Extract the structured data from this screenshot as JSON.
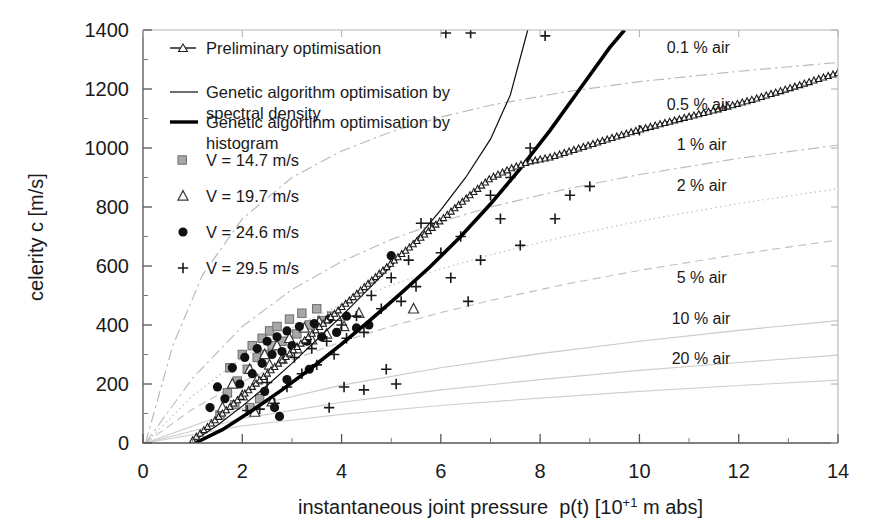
{
  "chart_data": {
    "type": "scatter",
    "title": "",
    "xlabel": "instantaneous joint pressure  p(t) [10+1 m abs]",
    "xlabel_main": "instantaneous joint pressure  p(t) [10",
    "xlabel_sup": "+1",
    "xlabel_tail": " m abs]",
    "ylabel": "celerity c [m/s]",
    "xlim": [
      0,
      14
    ],
    "ylim": [
      0,
      1400
    ],
    "xticks": [
      "0",
      "2",
      "4",
      "6",
      "8",
      "10",
      "12",
      "14"
    ],
    "xtick_values": [
      0,
      2,
      4,
      6,
      8,
      10,
      12,
      14
    ],
    "yticks": [
      "0",
      "200",
      "400",
      "600",
      "800",
      "1000",
      "1200",
      "1400"
    ],
    "ytick_values": [
      0,
      200,
      400,
      600,
      800,
      1000,
      1200,
      1400
    ],
    "x_minor_step": 0.5,
    "y_minor_step": 100,
    "grid": false,
    "legend_position": "upper-left-inside",
    "series": [
      {
        "name": "Preliminary optimisation",
        "style": "line-with-open-triangle-markers",
        "color": "#202020",
        "points": [
          [
            1.0,
            10
          ],
          [
            1.2,
            40
          ],
          [
            1.5,
            85
          ],
          [
            1.8,
            130
          ],
          [
            2.0,
            160
          ],
          [
            2.3,
            205
          ],
          [
            2.6,
            250
          ],
          [
            3.0,
            310
          ],
          [
            3.4,
            370
          ],
          [
            3.8,
            430
          ],
          [
            4.2,
            490
          ],
          [
            4.6,
            550
          ],
          [
            5.0,
            610
          ],
          [
            5.4,
            668
          ],
          [
            5.8,
            726
          ],
          [
            6.2,
            784
          ],
          [
            6.6,
            842
          ],
          [
            7.0,
            898
          ],
          [
            7.4,
            930
          ],
          [
            7.8,
            955
          ],
          [
            8.2,
            968
          ],
          [
            8.8,
            1000
          ],
          [
            9.4,
            1032
          ],
          [
            10.0,
            1062
          ],
          [
            10.8,
            1098
          ],
          [
            11.6,
            1132
          ],
          [
            12.4,
            1170
          ],
          [
            13.2,
            1212
          ],
          [
            14.0,
            1255
          ]
        ]
      },
      {
        "name": "Genetic algorithm optimisation by spectral density",
        "style": "thin-solid-line",
        "color": "#111111",
        "points": [
          [
            1.0,
            5
          ],
          [
            1.5,
            60
          ],
          [
            2.0,
            125
          ],
          [
            2.5,
            195
          ],
          [
            3.0,
            270
          ],
          [
            3.5,
            350
          ],
          [
            4.0,
            430
          ],
          [
            4.5,
            515
          ],
          [
            5.0,
            600
          ],
          [
            5.5,
            690
          ],
          [
            6.0,
            790
          ],
          [
            6.5,
            900
          ],
          [
            7.0,
            1030
          ],
          [
            7.4,
            1180
          ],
          [
            7.75,
            1400
          ]
        ]
      },
      {
        "name": "Genetic algortihm optimisation by histogram",
        "style": "thick-solid-line",
        "color": "#000000",
        "points": [
          [
            1.05,
            0
          ],
          [
            1.6,
            45
          ],
          [
            2.2,
            110
          ],
          [
            2.8,
            180
          ],
          [
            3.4,
            255
          ],
          [
            4.0,
            335
          ],
          [
            4.6,
            420
          ],
          [
            5.2,
            508
          ],
          [
            5.8,
            600
          ],
          [
            6.4,
            700
          ],
          [
            7.0,
            810
          ],
          [
            7.6,
            930
          ],
          [
            8.2,
            1060
          ],
          [
            8.8,
            1200
          ],
          [
            9.4,
            1340
          ],
          [
            9.7,
            1400
          ]
        ]
      },
      {
        "name": "V = 14.7 m/s",
        "style": "gray-square-markers",
        "color": "#9a9a9a",
        "points": [
          [
            1.55,
            95
          ],
          [
            1.7,
            170
          ],
          [
            1.75,
            255
          ],
          [
            1.9,
            210
          ],
          [
            2.0,
            300
          ],
          [
            2.1,
            250
          ],
          [
            2.2,
            330
          ],
          [
            2.3,
            290
          ],
          [
            2.4,
            355
          ],
          [
            2.45,
            300
          ],
          [
            2.55,
            380
          ],
          [
            2.6,
            330
          ],
          [
            2.7,
            395
          ],
          [
            2.8,
            345
          ],
          [
            2.95,
            420
          ],
          [
            3.1,
            370
          ],
          [
            3.2,
            440
          ],
          [
            3.35,
            400
          ],
          [
            3.5,
            455
          ],
          [
            3.6,
            415
          ],
          [
            3.8,
            430
          ],
          [
            2.15,
            120
          ],
          [
            2.35,
            150
          ],
          [
            1.85,
            130
          ]
        ]
      },
      {
        "name": "V = 19.7 m/s",
        "style": "open-triangle-markers",
        "color": "#4a4a4a",
        "points": [
          [
            1.6,
            120
          ],
          [
            1.8,
            200
          ],
          [
            2.0,
            160
          ],
          [
            2.15,
            250
          ],
          [
            2.3,
            215
          ],
          [
            2.45,
            300
          ],
          [
            2.55,
            265
          ],
          [
            2.7,
            330
          ],
          [
            2.8,
            285
          ],
          [
            2.95,
            355
          ],
          [
            3.1,
            320
          ],
          [
            3.25,
            390
          ],
          [
            3.4,
            350
          ],
          [
            3.55,
            410
          ],
          [
            3.7,
            370
          ],
          [
            3.9,
            430
          ],
          [
            4.05,
            395
          ],
          [
            4.35,
            440
          ],
          [
            5.45,
            455
          ],
          [
            2.25,
            105
          ],
          [
            2.6,
            140
          ]
        ]
      },
      {
        "name": "V = 24.6 m/s",
        "style": "filled-circle-markers",
        "color": "#111111",
        "points": [
          [
            1.35,
            120
          ],
          [
            1.5,
            190
          ],
          [
            1.65,
            150
          ],
          [
            1.8,
            255
          ],
          [
            1.95,
            200
          ],
          [
            2.05,
            290
          ],
          [
            2.2,
            235
          ],
          [
            2.3,
            320
          ],
          [
            2.4,
            270
          ],
          [
            2.5,
            345
          ],
          [
            2.6,
            300
          ],
          [
            2.7,
            360
          ],
          [
            2.8,
            310
          ],
          [
            2.9,
            380
          ],
          [
            3.0,
            330
          ],
          [
            3.15,
            395
          ],
          [
            3.3,
            345
          ],
          [
            3.45,
            405
          ],
          [
            3.6,
            360
          ],
          [
            3.75,
            420
          ],
          [
            3.9,
            375
          ],
          [
            4.1,
            430
          ],
          [
            4.3,
            390
          ],
          [
            4.55,
            400
          ],
          [
            5.0,
            635
          ],
          [
            2.45,
            175
          ],
          [
            2.9,
            215
          ],
          [
            3.35,
            250
          ],
          [
            2.65,
            120
          ],
          [
            2.75,
            90
          ]
        ]
      },
      {
        "name": "V = 29.5 m/s",
        "style": "plus-markers",
        "color": "#1a1a1a",
        "points": [
          [
            2.1,
            110
          ],
          [
            2.35,
            115
          ],
          [
            2.5,
            205
          ],
          [
            2.65,
            135
          ],
          [
            2.9,
            190
          ],
          [
            3.05,
            290
          ],
          [
            3.2,
            235
          ],
          [
            3.4,
            320
          ],
          [
            3.5,
            265
          ],
          [
            3.7,
            345
          ],
          [
            3.85,
            300
          ],
          [
            4.0,
            400
          ],
          [
            4.1,
            355
          ],
          [
            4.3,
            430
          ],
          [
            4.45,
            375
          ],
          [
            4.6,
            500
          ],
          [
            4.8,
            455
          ],
          [
            5.0,
            560
          ],
          [
            5.2,
            480
          ],
          [
            5.35,
            620
          ],
          [
            5.5,
            530
          ],
          [
            5.6,
            745
          ],
          [
            5.8,
            745
          ],
          [
            6.0,
            645
          ],
          [
            6.2,
            560
          ],
          [
            6.4,
            700
          ],
          [
            6.55,
            480
          ],
          [
            6.8,
            620
          ],
          [
            7.0,
            840
          ],
          [
            7.2,
            760
          ],
          [
            7.4,
            900
          ],
          [
            7.6,
            670
          ],
          [
            7.8,
            1000
          ],
          [
            8.1,
            1380
          ],
          [
            8.3,
            760
          ],
          [
            8.6,
            840
          ],
          [
            9.0,
            870
          ],
          [
            10.0,
            1060
          ],
          [
            6.1,
            1390
          ],
          [
            6.6,
            1390
          ],
          [
            4.05,
            190
          ],
          [
            4.45,
            180
          ],
          [
            5.1,
            200
          ],
          [
            3.75,
            120
          ],
          [
            4.9,
            250
          ]
        ]
      }
    ],
    "air_curves": [
      {
        "label": "0.1 % air",
        "percent": 0.1,
        "dash": "dash-dot",
        "color": "#b9b9b9",
        "points": [
          [
            0.05,
            0
          ],
          [
            0.6,
            330
          ],
          [
            1.2,
            570
          ],
          [
            2.0,
            760
          ],
          [
            3.0,
            900
          ],
          [
            4.0,
            990
          ],
          [
            5.0,
            1055
          ],
          [
            6.0,
            1105
          ],
          [
            7.0,
            1145
          ],
          [
            8.5,
            1190
          ],
          [
            10.0,
            1225
          ],
          [
            12.0,
            1260
          ],
          [
            14.0,
            1290
          ]
        ]
      },
      {
        "label": "0.5 % air",
        "percent": 0.5,
        "dash": "dash-dot",
        "color": "#bdbdbd",
        "points": [
          [
            0.05,
            0
          ],
          [
            1.0,
            220
          ],
          [
            2.0,
            395
          ],
          [
            3.0,
            520
          ],
          [
            4.0,
            615
          ],
          [
            5.0,
            690
          ],
          [
            6.0,
            750
          ],
          [
            7.0,
            800
          ],
          [
            8.5,
            860
          ],
          [
            10.0,
            910
          ],
          [
            12.0,
            965
          ],
          [
            14.0,
            1010
          ]
        ]
      },
      {
        "label": "1 % air",
        "percent": 1,
        "dash": "dotted",
        "color": "#c0c0c0",
        "points": [
          [
            0.05,
            0
          ],
          [
            1.0,
            160
          ],
          [
            2.0,
            290
          ],
          [
            3.0,
            390
          ],
          [
            4.0,
            470
          ],
          [
            5.0,
            535
          ],
          [
            6.0,
            590
          ],
          [
            7.0,
            638
          ],
          [
            8.5,
            700
          ],
          [
            10.0,
            752
          ],
          [
            12.0,
            812
          ],
          [
            14.0,
            862
          ]
        ]
      },
      {
        "label": "2 % air",
        "percent": 2,
        "dash": "dashed",
        "color": "#c2c2c2",
        "points": [
          [
            0.05,
            0
          ],
          [
            1.0,
            115
          ],
          [
            2.0,
            208
          ],
          [
            3.0,
            282
          ],
          [
            4.0,
            343
          ],
          [
            5.0,
            396
          ],
          [
            6.0,
            442
          ],
          [
            7.0,
            483
          ],
          [
            8.5,
            538
          ],
          [
            10.0,
            585
          ],
          [
            12.0,
            640
          ],
          [
            14.0,
            688
          ]
        ]
      },
      {
        "label": "5 % air",
        "percent": 5,
        "dash": "solid",
        "color": "#cacaca",
        "points": [
          [
            0.05,
            0
          ],
          [
            2.0,
            118
          ],
          [
            4.0,
            196
          ],
          [
            6.0,
            255
          ],
          [
            8.0,
            303
          ],
          [
            10.0,
            345
          ],
          [
            12.0,
            382
          ],
          [
            14.0,
            415
          ]
        ]
      },
      {
        "label": "10 % air",
        "percent": 10,
        "dash": "solid",
        "color": "#cdcdcd",
        "points": [
          [
            0.05,
            0
          ],
          [
            2.0,
            83
          ],
          [
            4.0,
            138
          ],
          [
            6.0,
            180
          ],
          [
            8.0,
            215
          ],
          [
            10.0,
            246
          ],
          [
            12.0,
            273
          ],
          [
            14.0,
            298
          ]
        ]
      },
      {
        "label": "20 % air",
        "percent": 20,
        "dash": "solid",
        "color": "#d0d0d0",
        "points": [
          [
            0.05,
            0
          ],
          [
            2.0,
            58
          ],
          [
            4.0,
            97
          ],
          [
            6.0,
            127
          ],
          [
            8.0,
            152
          ],
          [
            10.0,
            175
          ],
          [
            12.0,
            195
          ],
          [
            14.0,
            213
          ]
        ]
      }
    ],
    "air_labels": [
      {
        "text": "0.1 % air",
        "x": 10.55,
        "y": 1338
      },
      {
        "text": "0.5 % air",
        "x": 10.55,
        "y": 1146
      },
      {
        "text": "1 % air",
        "x": 10.75,
        "y": 1010
      },
      {
        "text": "2 % air",
        "x": 10.75,
        "y": 870
      },
      {
        "text": "5 % air",
        "x": 10.75,
        "y": 560
      },
      {
        "text": "10 % air",
        "x": 10.65,
        "y": 420
      },
      {
        "text": "20 % air",
        "x": 10.65,
        "y": 285
      }
    ],
    "legend": [
      {
        "label": "Preliminary optimisation",
        "marker": "line-triangle",
        "line2": ""
      },
      {
        "label": "Genetic algorithm optimisation by",
        "marker": "thin-line",
        "line2": "spectral density"
      },
      {
        "label": "Genetic algortihm optimisation by",
        "marker": "thick-line",
        "line2": "histogram"
      },
      {
        "label": "V = 14.7 m/s",
        "marker": "square",
        "line2": ""
      },
      {
        "label": "V = 19.7 m/s",
        "marker": "triangle",
        "line2": ""
      },
      {
        "label": "V = 24.6 m/s",
        "marker": "circle",
        "line2": ""
      },
      {
        "label": "V = 29.5 m/s",
        "marker": "plus",
        "line2": ""
      }
    ]
  }
}
